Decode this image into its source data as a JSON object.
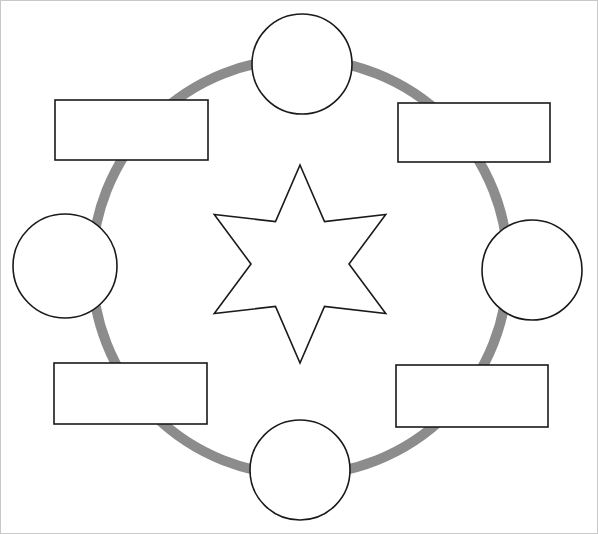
{
  "diagram": {
    "type": "blank-cycle-template",
    "canvas": {
      "width": 598,
      "height": 534,
      "background": "#ffffff"
    },
    "border": {
      "visible": true,
      "color": "#c8c8c8",
      "width": 1
    },
    "ring": {
      "name": "cycle-ring",
      "shape": "circle",
      "color": "#8c8c8c",
      "stroke_width": 10,
      "center_x": 300,
      "center_y": 267,
      "radius": 208
    },
    "center": {
      "name": "center-star",
      "shape": "six-pointed-star",
      "points": 6,
      "label": "",
      "fill": "#ffffff",
      "stroke": "#1a1a1a",
      "stroke_width": 1.6,
      "center_x": 300,
      "center_y": 264,
      "outer_radius": 99,
      "inner_radius": 49,
      "rotation_deg": -90
    },
    "circles": [
      {
        "name": "circle-node-top",
        "position": "top",
        "label": "",
        "cx": 302,
        "cy": 64,
        "r": 50,
        "fill": "#ffffff",
        "stroke": "#1a1a1a",
        "stroke_width": 1.6
      },
      {
        "name": "circle-node-right",
        "position": "right",
        "label": "",
        "cx": 532,
        "cy": 270,
        "r": 50,
        "fill": "#ffffff",
        "stroke": "#1a1a1a",
        "stroke_width": 1.6
      },
      {
        "name": "circle-node-bottom",
        "position": "bottom",
        "label": "",
        "cx": 300,
        "cy": 470,
        "r": 50,
        "fill": "#ffffff",
        "stroke": "#1a1a1a",
        "stroke_width": 1.6
      },
      {
        "name": "circle-node-left",
        "position": "left",
        "label": "",
        "cx": 65,
        "cy": 266,
        "r": 52,
        "fill": "#ffffff",
        "stroke": "#1a1a1a",
        "stroke_width": 1.6
      }
    ],
    "rectangles": [
      {
        "name": "rect-node-top-left",
        "position": "top-left",
        "label": "",
        "x": 55,
        "y": 100,
        "width": 153,
        "height": 60,
        "fill": "#ffffff",
        "stroke": "#1a1a1a",
        "stroke_width": 1.6
      },
      {
        "name": "rect-node-top-right",
        "position": "top-right",
        "label": "",
        "x": 398,
        "y": 103,
        "width": 152,
        "height": 59,
        "fill": "#ffffff",
        "stroke": "#1a1a1a",
        "stroke_width": 1.6
      },
      {
        "name": "rect-node-bottom-left",
        "position": "bottom-left",
        "label": "",
        "x": 54,
        "y": 363,
        "width": 153,
        "height": 61,
        "fill": "#ffffff",
        "stroke": "#1a1a1a",
        "stroke_width": 1.6
      },
      {
        "name": "rect-node-bottom-right",
        "position": "bottom-right",
        "label": "",
        "x": 396,
        "y": 365,
        "width": 152,
        "height": 62,
        "fill": "#ffffff",
        "stroke": "#1a1a1a",
        "stroke_width": 1.6
      }
    ]
  }
}
